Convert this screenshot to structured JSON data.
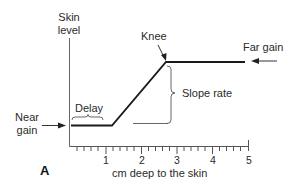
{
  "figure": {
    "panel_label": "A",
    "y_axis_label_line1": "Skin",
    "y_axis_label_line2": "level",
    "x_axis_label": "cm deep to the skin",
    "x_ticks": [
      "1",
      "2",
      "3",
      "4",
      "5"
    ],
    "annotations": {
      "near_gain_line1": "Near",
      "near_gain_line2": "gain",
      "delay": "Delay",
      "knee": "Knee",
      "slope_rate": "Slope rate",
      "far_gain": "Far gain"
    },
    "colors": {
      "line": "#1a1a1a",
      "axis": "#555555",
      "text": "#2a2a2a",
      "background": "#ffffff"
    }
  },
  "curve": {
    "description": "TGC (time gain compensation) curve",
    "points_cm": [
      [
        0,
        "near gain"
      ],
      [
        1.2,
        "near gain"
      ],
      [
        2.7,
        "far gain (knee)"
      ],
      [
        4.9,
        "far gain"
      ]
    ],
    "x_range_cm": [
      0,
      5
    ],
    "minor_ticks_per_cm": 5
  }
}
